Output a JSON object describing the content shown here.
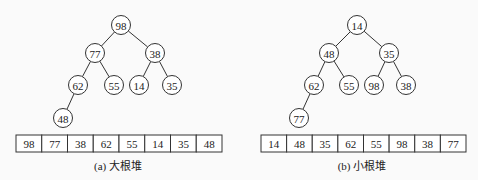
{
  "heaps": [
    {
      "id": "max-heap",
      "caption": "(a) 大根堆",
      "caption_pos": [
        118,
        170
      ],
      "nodes": [
        {
          "value": "98",
          "x": 121,
          "y": 25
        },
        {
          "value": "77",
          "x": 95,
          "y": 53
        },
        {
          "value": "38",
          "x": 155,
          "y": 53
        },
        {
          "value": "62",
          "x": 78,
          "y": 85
        },
        {
          "value": "55",
          "x": 114,
          "y": 85
        },
        {
          "value": "14",
          "x": 139,
          "y": 85
        },
        {
          "value": "35",
          "x": 172,
          "y": 85
        },
        {
          "value": "48",
          "x": 63,
          "y": 118
        }
      ],
      "edges": [
        [
          0,
          1
        ],
        [
          0,
          2
        ],
        [
          1,
          3
        ],
        [
          1,
          4
        ],
        [
          2,
          5
        ],
        [
          2,
          6
        ],
        [
          3,
          7
        ]
      ],
      "array": {
        "x": 16,
        "y": 135,
        "width": 206,
        "height": 17,
        "values": [
          "98",
          "77",
          "38",
          "62",
          "55",
          "14",
          "35",
          "48"
        ]
      }
    },
    {
      "id": "min-heap",
      "caption": "(b) 小根堆",
      "caption_pos": [
        362,
        170
      ],
      "nodes": [
        {
          "value": "14",
          "x": 357,
          "y": 25
        },
        {
          "value": "48",
          "x": 329,
          "y": 53
        },
        {
          "value": "35",
          "x": 389,
          "y": 53
        },
        {
          "value": "62",
          "x": 314,
          "y": 85
        },
        {
          "value": "55",
          "x": 349,
          "y": 85
        },
        {
          "value": "98",
          "x": 374,
          "y": 85
        },
        {
          "value": "38",
          "x": 406,
          "y": 85
        },
        {
          "value": "77",
          "x": 299,
          "y": 118
        }
      ],
      "edges": [
        [
          0,
          1
        ],
        [
          0,
          2
        ],
        [
          1,
          3
        ],
        [
          1,
          4
        ],
        [
          2,
          5
        ],
        [
          2,
          6
        ],
        [
          3,
          7
        ]
      ],
      "array": {
        "x": 261,
        "y": 135,
        "width": 205,
        "height": 17,
        "values": [
          "14",
          "48",
          "35",
          "62",
          "55",
          "98",
          "38",
          "77"
        ]
      }
    }
  ],
  "node_radius": 9.5
}
